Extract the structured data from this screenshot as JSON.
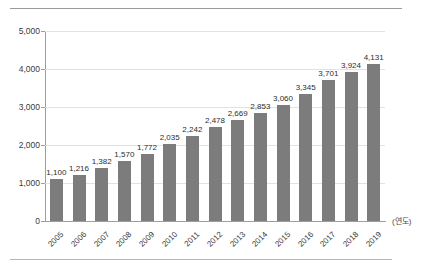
{
  "header": {
    "ghost_text": ""
  },
  "chart_data": {
    "type": "bar",
    "title": "",
    "subtitle": "",
    "xlabel": "(연도)",
    "ylabel": "",
    "categories": [
      "2005",
      "2006",
      "2007",
      "2008",
      "2009",
      "2010",
      "2011",
      "2012",
      "2013",
      "2014",
      "2015",
      "2016",
      "2017",
      "2018",
      "2019"
    ],
    "values": [
      1100,
      1216,
      1382,
      1570,
      1772,
      2035,
      2242,
      2478,
      2669,
      2853,
      3060,
      3345,
      3701,
      3924,
      4131
    ],
    "value_labels": [
      "1,100",
      "1,216",
      "1,382",
      "1,570",
      "1,772",
      "2,035",
      "2,242",
      "2,478",
      "2,669",
      "2,853",
      "3,060",
      "3,345",
      "3,701",
      "3,924",
      "4,131"
    ],
    "ylim": [
      0,
      5000
    ],
    "yticks": [
      0,
      1000,
      2000,
      3000,
      4000,
      5000
    ],
    "ytick_labels": [
      "0",
      "1,000",
      "2,000",
      "3,000",
      "4,000",
      "5,000"
    ],
    "grid": true,
    "legend": "none",
    "legend_position": "none",
    "bar_color": "#7c7c7c",
    "grid_color": "#e2e2e2",
    "axis_color": "#9d9d9d",
    "text_color": "#3a3a3a"
  }
}
